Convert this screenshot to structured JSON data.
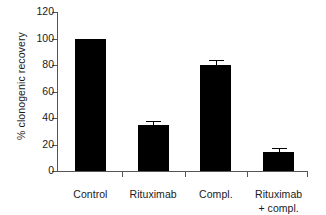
{
  "chart_data": {
    "type": "bar",
    "title": "",
    "xlabel": "",
    "ylabel": "% clonogenic recovery",
    "categories": [
      "Control",
      "Rituximab",
      "Compl.",
      "Rituximab + compl."
    ],
    "category_lines": [
      [
        "Control"
      ],
      [
        "Rituximab"
      ],
      [
        "Compl."
      ],
      [
        "Rituximab",
        "+ compl."
      ]
    ],
    "values": [
      100,
      35,
      80,
      14
    ],
    "errors": [
      0,
      3,
      3.5,
      3
    ],
    "ylim": [
      0,
      120
    ],
    "yticks": [
      0,
      20,
      40,
      60,
      80,
      100,
      120
    ],
    "ytick_labels": [
      "0",
      "20",
      "40",
      "60",
      "80",
      "100",
      "120"
    ],
    "grid": false,
    "legend": null,
    "bar_color": "#000000",
    "axis_color": "#555555",
    "text_color": "#1a1a1a",
    "background": "#ffffff"
  }
}
